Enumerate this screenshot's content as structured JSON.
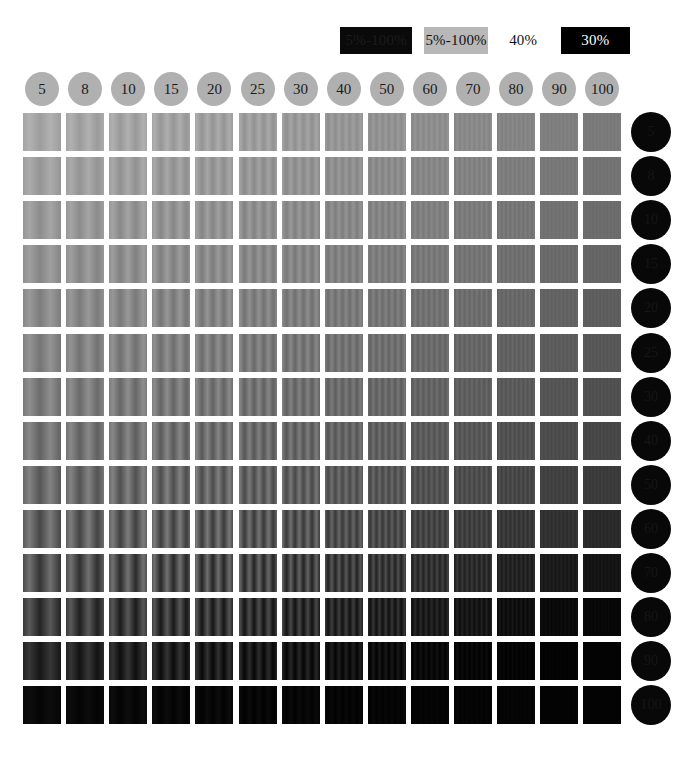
{
  "legend": {
    "items": [
      {
        "label": "5%-100%",
        "style": "box-dark",
        "name": "legend-swatch-dark"
      },
      {
        "label": "5%-100%",
        "style": "box-gray",
        "name": "legend-swatch-gray"
      },
      {
        "label": "40%",
        "style": "box-plain",
        "name": "legend-swatch-plain"
      },
      {
        "label": "30%",
        "style": "box-black",
        "name": "legend-swatch-black"
      }
    ]
  },
  "columns": {
    "label": "spatial frequency",
    "values": [
      "5",
      "8",
      "10",
      "15",
      "20",
      "25",
      "30",
      "40",
      "50",
      "60",
      "70",
      "80",
      "90",
      "100"
    ]
  },
  "rows": {
    "label": "contrast level",
    "values": [
      "5",
      "8",
      "10",
      "15",
      "20",
      "25",
      "30",
      "40",
      "50",
      "60",
      "70",
      "80",
      "90",
      "100"
    ]
  },
  "chart_data": {
    "type": "heatmap",
    "xlabel": "spatial frequency",
    "ylabel": "contrast",
    "grid": false,
    "legend_position": "top-right",
    "categories_x": [
      "5",
      "8",
      "10",
      "15",
      "20",
      "25",
      "30",
      "40",
      "50",
      "60",
      "70",
      "80",
      "90",
      "100"
    ],
    "categories_y": [
      "5",
      "8",
      "10",
      "15",
      "20",
      "25",
      "30",
      "40",
      "50",
      "60",
      "70",
      "80",
      "90",
      "100"
    ],
    "cell_geometry": {
      "cols": 14,
      "rows": 14,
      "cell_w": 38,
      "cell_h": 38,
      "gap_x": 5.1,
      "gap_y": 6.1
    },
    "mean_luminance": [
      [
        167,
        166,
        164,
        162,
        160,
        157,
        154,
        150,
        146,
        142,
        137,
        132,
        127,
        122
      ],
      [
        160,
        159,
        157,
        155,
        153,
        150,
        147,
        143,
        139,
        135,
        130,
        125,
        120,
        115
      ],
      [
        153,
        152,
        150,
        148,
        146,
        143,
        140,
        136,
        132,
        128,
        123,
        118,
        113,
        108
      ],
      [
        146,
        145,
        143,
        141,
        139,
        136,
        133,
        129,
        125,
        121,
        116,
        111,
        106,
        101
      ],
      [
        139,
        138,
        136,
        134,
        132,
        129,
        126,
        122,
        118,
        114,
        109,
        104,
        99,
        94
      ],
      [
        132,
        131,
        129,
        127,
        125,
        122,
        119,
        115,
        111,
        107,
        102,
        97,
        92,
        87
      ],
      [
        125,
        124,
        122,
        120,
        118,
        115,
        112,
        108,
        104,
        100,
        95,
        90,
        85,
        80
      ],
      [
        117,
        116,
        114,
        112,
        110,
        107,
        104,
        100,
        96,
        92,
        87,
        81,
        76,
        71
      ],
      [
        108,
        107,
        105,
        103,
        101,
        98,
        95,
        91,
        87,
        82,
        77,
        71,
        65,
        59
      ],
      [
        97,
        96,
        94,
        92,
        89,
        86,
        83,
        79,
        74,
        69,
        63,
        56,
        49,
        42
      ],
      [
        82,
        80,
        78,
        76,
        73,
        70,
        66,
        61,
        56,
        50,
        43,
        35,
        27,
        20
      ],
      [
        62,
        60,
        57,
        55,
        52,
        48,
        44,
        39,
        34,
        28,
        22,
        15,
        10,
        7
      ],
      [
        38,
        36,
        33,
        31,
        28,
        25,
        21,
        17,
        13,
        9,
        6,
        4,
        3,
        3
      ],
      [
        9,
        8,
        8,
        7,
        7,
        6,
        6,
        5,
        5,
        4,
        4,
        4,
        3,
        3
      ]
    ],
    "contrast_amplitude": [
      [
        10,
        11,
        12,
        12,
        12,
        12,
        11,
        10,
        9,
        8,
        7,
        6,
        5,
        4
      ],
      [
        11,
        12,
        13,
        13,
        13,
        13,
        12,
        11,
        10,
        9,
        8,
        6,
        5,
        4
      ],
      [
        12,
        13,
        14,
        14,
        14,
        14,
        13,
        12,
        11,
        9,
        8,
        7,
        5,
        4
      ],
      [
        13,
        14,
        15,
        15,
        15,
        15,
        14,
        13,
        11,
        10,
        8,
        7,
        6,
        4
      ],
      [
        14,
        15,
        16,
        17,
        17,
        16,
        15,
        14,
        12,
        11,
        9,
        7,
        6,
        5
      ],
      [
        15,
        17,
        18,
        18,
        18,
        18,
        17,
        15,
        13,
        11,
        9,
        8,
        6,
        5
      ],
      [
        17,
        18,
        20,
        20,
        20,
        20,
        18,
        16,
        14,
        12,
        10,
        8,
        6,
        5
      ],
      [
        19,
        21,
        22,
        23,
        23,
        22,
        21,
        18,
        16,
        13,
        11,
        9,
        7,
        5
      ],
      [
        22,
        24,
        26,
        27,
        27,
        26,
        24,
        21,
        18,
        15,
        12,
        10,
        7,
        5
      ],
      [
        26,
        29,
        31,
        32,
        32,
        31,
        29,
        25,
        21,
        17,
        14,
        11,
        8,
        6
      ],
      [
        30,
        33,
        36,
        37,
        37,
        36,
        33,
        29,
        24,
        20,
        15,
        11,
        8,
        5
      ],
      [
        26,
        29,
        31,
        32,
        32,
        31,
        28,
        24,
        20,
        15,
        11,
        8,
        5,
        3
      ],
      [
        16,
        18,
        20,
        21,
        21,
        20,
        18,
        15,
        12,
        9,
        6,
        4,
        2,
        1
      ],
      [
        4,
        4,
        5,
        5,
        5,
        5,
        4,
        4,
        3,
        2,
        2,
        1,
        1,
        1
      ]
    ],
    "cycles_per_patch": [
      2.2,
      2.6,
      3.0,
      3.6,
      4.2,
      4.8,
      5.4,
      6.4,
      7.4,
      8.4,
      9.4,
      10.6,
      11.8,
      13.0
    ]
  }
}
